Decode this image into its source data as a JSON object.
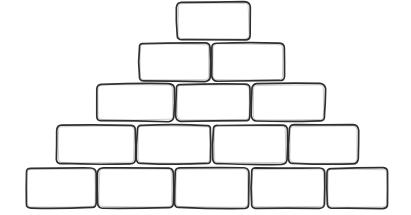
{
  "diagram": {
    "shape_type": "pyramid-of-bricks",
    "row_count": 5,
    "brick_count_total": 15,
    "background_color": "#ffffff",
    "outline_color": "#2e2e2e",
    "fill_color": "#ffffff",
    "style": "hand-drawn rounded rectangles, empty (no text inside bricks)",
    "corner_radius": 5,
    "rows": [
      {
        "row_index": 1,
        "brick_count": 1,
        "y": 2,
        "height": 38,
        "bricks": [
          {
            "label": "",
            "x": 177,
            "y": 2,
            "width": 73,
            "height": 38
          }
        ]
      },
      {
        "row_index": 2,
        "brick_count": 2,
        "y": 43,
        "height": 38,
        "bricks": [
          {
            "label": "",
            "x": 139,
            "y": 43,
            "width": 71,
            "height": 38
          },
          {
            "label": "",
            "x": 212,
            "y": 43,
            "width": 72,
            "height": 38
          }
        ]
      },
      {
        "row_index": 3,
        "brick_count": 3,
        "y": 84,
        "height": 37,
        "bricks": [
          {
            "label": "",
            "x": 97,
            "y": 84,
            "width": 77,
            "height": 37
          },
          {
            "label": "",
            "x": 176,
            "y": 84,
            "width": 74,
            "height": 37
          },
          {
            "label": "",
            "x": 252,
            "y": 84,
            "width": 73,
            "height": 37
          }
        ]
      },
      {
        "row_index": 4,
        "brick_count": 4,
        "y": 125,
        "height": 39,
        "bricks": [
          {
            "label": "",
            "x": 57,
            "y": 125,
            "width": 78,
            "height": 39
          },
          {
            "label": "",
            "x": 137,
            "y": 125,
            "width": 74,
            "height": 39
          },
          {
            "label": "",
            "x": 213,
            "y": 125,
            "width": 74,
            "height": 39
          },
          {
            "label": "",
            "x": 289,
            "y": 125,
            "width": 69,
            "height": 39
          }
        ]
      },
      {
        "row_index": 5,
        "brick_count": 5,
        "y": 168,
        "height": 40,
        "bricks": [
          {
            "label": "",
            "x": 26,
            "y": 168,
            "width": 70,
            "height": 40
          },
          {
            "label": "",
            "x": 98,
            "y": 168,
            "width": 75,
            "height": 40
          },
          {
            "label": "",
            "x": 175,
            "y": 168,
            "width": 74,
            "height": 40
          },
          {
            "label": "",
            "x": 251,
            "y": 168,
            "width": 74,
            "height": 40
          },
          {
            "label": "",
            "x": 327,
            "y": 168,
            "width": 61,
            "height": 40
          }
        ]
      }
    ]
  }
}
